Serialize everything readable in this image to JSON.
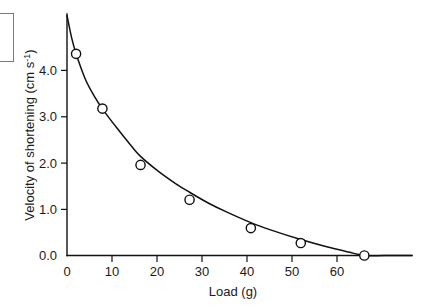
{
  "chart_data": {
    "type": "line",
    "title": "",
    "xlabel": "Load (g)",
    "ylabel": "Velocity of shortening (cm s",
    "ylabel_superscript": "-1",
    "ylabel_suffix": ")",
    "xlabel_text": "Load",
    "xlabel_units": "(g)",
    "xlim": [
      0,
      76
    ],
    "ylim": [
      0,
      4.85
    ],
    "grid": false,
    "legend": false,
    "legend_position": "none",
    "marker_style": "open-circle",
    "x_ticks": [
      0,
      10,
      20,
      30,
      40,
      50,
      60
    ],
    "x_tick_labels": [
      "0",
      "10",
      "20",
      "30",
      "40",
      "50",
      "60"
    ],
    "y_ticks": [
      0.0,
      1.0,
      2.0,
      3.0,
      4.0
    ],
    "y_tick_labels": [
      "0.0",
      "1.0",
      "2.0",
      "3.0",
      "4.0"
    ],
    "x": [
      2.0,
      7.8,
      16.2,
      27.0,
      40.5,
      51.5,
      65.5
    ],
    "values": [
      4.05,
      2.95,
      1.82,
      1.12,
      0.55,
      0.25,
      0.0
    ],
    "series": [
      {
        "name": "Velocity of shortening",
        "x": [
          2.0,
          7.8,
          16.2,
          27.0,
          40.5,
          51.5,
          65.5
        ],
        "values": [
          4.05,
          2.95,
          1.82,
          1.12,
          0.55,
          0.25,
          0.0
        ]
      }
    ],
    "curve_x": [
      0.0,
      1.0,
      2.0,
      4.0,
      6.0,
      8.0,
      11.0,
      14.0,
      16.2,
      20.0,
      24.0,
      27.0,
      31.0,
      35.0,
      40.5,
      45.0,
      51.5,
      57.0,
      62.0,
      65.5,
      70.0,
      76.0
    ],
    "curve_y": [
      4.82,
      4.38,
      4.05,
      3.55,
      3.2,
      2.92,
      2.56,
      2.22,
      1.99,
      1.7,
      1.44,
      1.27,
      1.06,
      0.88,
      0.66,
      0.51,
      0.32,
      0.18,
      0.07,
      0.0,
      0.0,
      0.0
    ]
  },
  "axes": {
    "y_axis_title_main": "Velocity of shortening (cm s",
    "y_axis_title_sup": "-1",
    "y_axis_title_end": ")",
    "x_axis_title": "Load (g)"
  },
  "ticks": {
    "y": [
      "4.0",
      "3.0",
      "2.0",
      "1.0",
      "0.0"
    ],
    "x": [
      "0",
      "10",
      "20",
      "30",
      "40",
      "50",
      "60"
    ]
  }
}
